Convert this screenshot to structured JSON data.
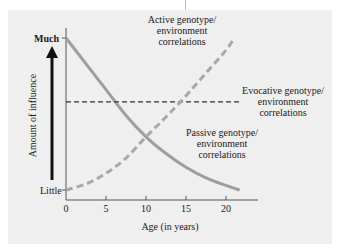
{
  "chart_data": {
    "type": "line",
    "title": "",
    "xlabel": "Age (in years)",
    "ylabel": "Amount of influence",
    "x_ticks": [
      "0",
      "5",
      "10",
      "15",
      "20"
    ],
    "y_ticks": [
      "Little",
      "Much"
    ],
    "xlim": [
      0,
      24
    ],
    "ylim": [
      0,
      100
    ],
    "grid": false,
    "series": [
      {
        "name": "Passive genotype/ environment correlations",
        "style": "solid",
        "color": "#9e9e9e",
        "x": [
          0,
          2.5,
          5,
          7.5,
          10,
          12.5,
          15,
          17.5,
          20,
          21.7
        ],
        "y": [
          100,
          83,
          66,
          49,
          35,
          24,
          15,
          8,
          3,
          0
        ]
      },
      {
        "name": "Evocative genotype/ environment correlations",
        "style": "dashed",
        "color": "#333333",
        "x": [
          0,
          21.7
        ],
        "y": [
          58,
          58
        ]
      },
      {
        "name": "Active genotype/ environment correlations",
        "style": "dashed",
        "color": "#a8a8a8",
        "x": [
          0,
          2.5,
          5,
          7.5,
          10,
          12.5,
          15,
          17.5,
          20,
          21
        ],
        "y": [
          0,
          4,
          11,
          21,
          35,
          48,
          62,
          77,
          92,
          100
        ]
      }
    ]
  },
  "labels": {
    "much": "Much",
    "little": "Little",
    "ylabel": "Amount of influence",
    "xlabel": "Age (in years)",
    "ticks": [
      "0",
      "5",
      "10",
      "15",
      "20"
    ],
    "active": [
      "Active genotype/",
      "environment",
      "correlations"
    ],
    "evocative": [
      "Evocative genotype/",
      "environment",
      "correlations"
    ],
    "passive": [
      "Passive genotype/",
      "environment",
      "correlations"
    ]
  }
}
